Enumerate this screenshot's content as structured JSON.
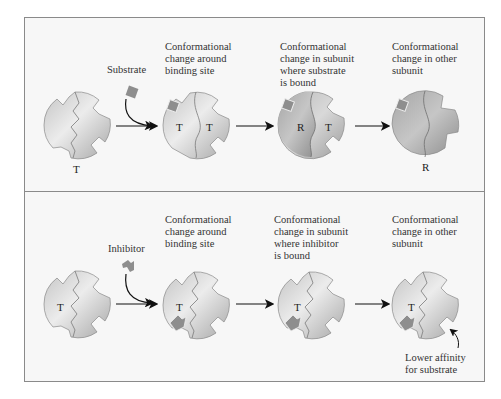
{
  "figure": {
    "top_panel": {
      "reactant_label": "Substrate",
      "steps": [
        {
          "caption": "",
          "states": [
            "T"
          ]
        },
        {
          "caption": "Conformational\nchange around\nbinding site",
          "states": [
            "T",
            "T"
          ]
        },
        {
          "caption": "Conformational\nchange in subunit\nwhere substrate\nis bound",
          "states": [
            "R",
            "T"
          ]
        },
        {
          "caption": "Conformational\nchange in other\nsubunit",
          "states": [
            "R"
          ]
        }
      ]
    },
    "bottom_panel": {
      "reactant_label": "Inhibitor",
      "steps": [
        {
          "caption": "",
          "states": [
            "T"
          ]
        },
        {
          "caption": "Conformational\nchange around\nbinding site",
          "states": [
            "T"
          ]
        },
        {
          "caption": "Conformational\nchange in subunit\nwhere inhibitor\nis bound",
          "states": [
            "T"
          ]
        },
        {
          "caption": "Conformational\nchange in other\nsubunit",
          "states": [
            "T"
          ]
        }
      ],
      "annotation": "Lower affinity\nfor substrate"
    },
    "colors": {
      "panel_bg": "#f7f7f7",
      "panel_border": "#8a8a8a",
      "enzyme_light": "#d8d8d8",
      "enzyme_dark": "#a9a9a9",
      "ligand": "#8e8e8e",
      "arrow": "#111111"
    }
  }
}
